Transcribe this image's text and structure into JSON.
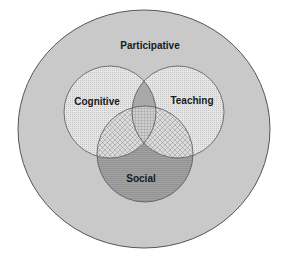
{
  "diagram": {
    "type": "venn",
    "outer": {
      "label": "Participative",
      "fill": "#c8c8c8"
    },
    "circles": [
      {
        "id": "cognitive",
        "label": "Cognitive",
        "fill": "#e4e4e4"
      },
      {
        "id": "teaching",
        "label": "Teaching",
        "fill": "#e4e4e4"
      },
      {
        "id": "social",
        "label": "Social",
        "fill": "#9a9a9a"
      }
    ],
    "colors": {
      "outline": "#444444",
      "background": "#ffffff"
    }
  }
}
